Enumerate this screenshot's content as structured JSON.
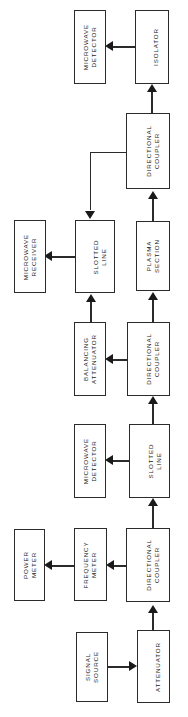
{
  "diagram": {
    "orientation": "rotated-90",
    "line_color": "#2b2b2b",
    "arrow_color": "#1a1a1a",
    "background": "#ffffff",
    "blocks": [
      {
        "id": "microwave-detector-top",
        "label": "MICROWAVE\nDETECTOR",
        "x": 74,
        "y": 10,
        "w": 32,
        "h": 74
      },
      {
        "id": "isolator",
        "label": "ISOLATOR",
        "x": 135,
        "y": 10,
        "w": 34,
        "h": 74
      },
      {
        "id": "directional-coupler-top",
        "label": "DIRECTIONAL\nCOUPLER",
        "x": 126,
        "y": 113,
        "w": 44,
        "h": 76
      },
      {
        "id": "microwave-receiver",
        "label": "MICROWAVE\nRECEIVER",
        "x": 14,
        "y": 220,
        "w": 32,
        "h": 73
      },
      {
        "id": "slotted-line-upper",
        "label": "SLOTTED\nLINE",
        "x": 75,
        "y": 220,
        "w": 40,
        "h": 73
      },
      {
        "id": "plasma-section",
        "label": "PLASMA\nSECTION",
        "x": 136,
        "y": 221,
        "w": 34,
        "h": 70
      },
      {
        "id": "balancing-attenuator",
        "label": "BALANCING\nATTENUATOR",
        "x": 74,
        "y": 322,
        "w": 32,
        "h": 74
      },
      {
        "id": "directional-coupler-mid",
        "label": "DIRECTIONAL\nCOUPLER",
        "x": 127,
        "y": 322,
        "w": 43,
        "h": 74
      },
      {
        "id": "microwave-detector-lower",
        "label": "MICROWAVE\nDETECTOR",
        "x": 74,
        "y": 424,
        "w": 32,
        "h": 74
      },
      {
        "id": "slotted-line-lower",
        "label": "SLOTTED\nLINE",
        "x": 129,
        "y": 424,
        "w": 41,
        "h": 74
      },
      {
        "id": "power-meter",
        "label": "POWER\nMETER",
        "x": 14,
        "y": 529,
        "w": 31,
        "h": 72
      },
      {
        "id": "frequency-meter",
        "label": "FREQUENCY\nMETER",
        "x": 74,
        "y": 528,
        "w": 33,
        "h": 73
      },
      {
        "id": "directional-coupler-bottom",
        "label": "DIRECTIONAL\nCOUPLER",
        "x": 126,
        "y": 528,
        "w": 44,
        "h": 74
      },
      {
        "id": "signal-source",
        "label": "SIGNAL\nSOURCE",
        "x": 76,
        "y": 632,
        "w": 32,
        "h": 70
      },
      {
        "id": "attenuator",
        "label": "ATTENUATOR",
        "x": 137,
        "y": 630,
        "w": 33,
        "h": 73
      }
    ],
    "connections": [
      {
        "id": "isolator-to-microwave-detector",
        "from": "isolator",
        "to": "microwave-detector-top"
      },
      {
        "id": "isolator-internal-up",
        "from": "isolator",
        "to": "isolator"
      },
      {
        "id": "directional-coupler-top-to-isolator",
        "from": "directional-coupler-top",
        "to": "isolator"
      },
      {
        "id": "directional-coupler-top-to-slotted-line-upper",
        "from": "directional-coupler-top",
        "to": "slotted-line-upper"
      },
      {
        "id": "plasma-section-to-directional-coupler-top",
        "from": "plasma-section",
        "to": "directional-coupler-top"
      },
      {
        "id": "slotted-line-upper-to-microwave-receiver",
        "from": "slotted-line-upper",
        "to": "microwave-receiver"
      },
      {
        "id": "balancing-attenuator-to-slotted-line-upper",
        "from": "balancing-attenuator",
        "to": "slotted-line-upper"
      },
      {
        "id": "directional-coupler-mid-to-balancing-attenuator",
        "from": "directional-coupler-mid",
        "to": "balancing-attenuator"
      },
      {
        "id": "directional-coupler-mid-to-plasma-section",
        "from": "directional-coupler-mid",
        "to": "plasma-section"
      },
      {
        "id": "slotted-line-lower-to-microwave-detector-lower",
        "from": "slotted-line-lower",
        "to": "microwave-detector-lower"
      },
      {
        "id": "slotted-line-lower-to-directional-coupler-mid",
        "from": "slotted-line-lower",
        "to": "directional-coupler-mid"
      },
      {
        "id": "directional-coupler-bottom-to-slotted-line-lower",
        "from": "directional-coupler-bottom",
        "to": "slotted-line-lower"
      },
      {
        "id": "directional-coupler-bottom-to-frequency-meter",
        "from": "directional-coupler-bottom",
        "to": "frequency-meter"
      },
      {
        "id": "frequency-meter-to-power-meter",
        "from": "frequency-meter",
        "to": "power-meter"
      },
      {
        "id": "attenuator-to-directional-coupler-bottom",
        "from": "attenuator",
        "to": "directional-coupler-bottom"
      },
      {
        "id": "signal-source-to-attenuator",
        "from": "signal-source",
        "to": "attenuator"
      }
    ]
  }
}
